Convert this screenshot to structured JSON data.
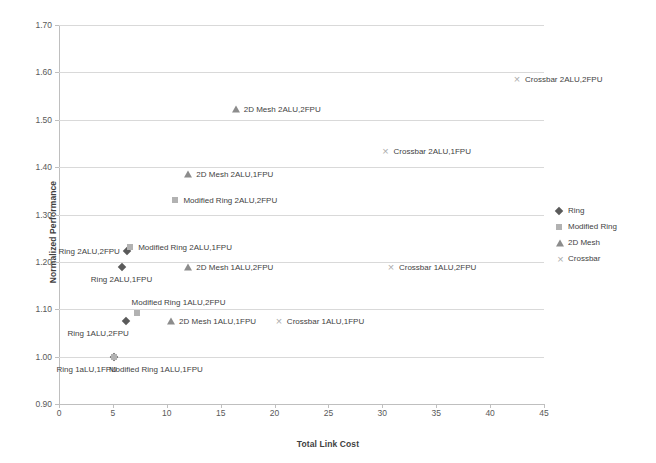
{
  "chart_data": {
    "type": "scatter",
    "title": "",
    "xlabel": "Total Link Cost",
    "ylabel": "Normalized Performance",
    "xlim": [
      0,
      45
    ],
    "ylim": [
      0.9,
      1.7
    ],
    "xticks": [
      "0",
      "5",
      "10",
      "15",
      "20",
      "25",
      "30",
      "35",
      "40",
      "45"
    ],
    "xtick_values": [
      0,
      5,
      10,
      15,
      20,
      25,
      30,
      35,
      40,
      45
    ],
    "yticks": [
      "0.90",
      "1.00",
      "1.10",
      "1.20",
      "1.30",
      "1.40",
      "1.50",
      "1.60",
      "1.70"
    ],
    "ytick_values": [
      0.9,
      1.0,
      1.1,
      1.2,
      1.3,
      1.4,
      1.5,
      1.6,
      1.7
    ],
    "grid": "horizontal",
    "legend_position": "right",
    "series": [
      {
        "name": "Ring",
        "marker": "diamond",
        "color": "#5a5a5a",
        "points": [
          {
            "label": "Ring 2ALU,2FPU",
            "x": 6.3,
            "y": 1.222,
            "label_side": "left"
          },
          {
            "label": "Ring 2ALU,1FPU",
            "x": 5.8,
            "y": 1.19,
            "label_side": "below"
          },
          {
            "label": "Ring 1ALU,2FPU",
            "x": 6.2,
            "y": 1.075,
            "label_side": "below-left"
          },
          {
            "label": "Ring 1aLU,1FPU",
            "x": 5.1,
            "y": 1.0,
            "label_side": "below-left"
          }
        ]
      },
      {
        "name": "Modified Ring",
        "marker": "square",
        "color": "#b2b2b2",
        "points": [
          {
            "label": "Modified Ring 2ALU,2FPU",
            "x": 10.8,
            "y": 1.33,
            "label_side": "right"
          },
          {
            "label": "Modified Ring 2ALU,1FPU",
            "x": 6.6,
            "y": 1.232,
            "label_side": "right"
          },
          {
            "label": "Modified Ring 1ALU,2FPU",
            "x": 7.2,
            "y": 1.093,
            "label_side": "above-right"
          },
          {
            "label": "Modified Ring 1ALU,1FPU",
            "x": 5.1,
            "y": 1.0,
            "label_side": "below-right"
          }
        ]
      },
      {
        "name": "2D Mesh",
        "marker": "triangle",
        "color": "#8c8c8c",
        "points": [
          {
            "label": "2D Mesh 2ALU,2FPU",
            "x": 16.4,
            "y": 1.522,
            "label_side": "right"
          },
          {
            "label": "2D Mesh 2ALU,1FPU",
            "x": 12.0,
            "y": 1.385,
            "label_side": "right"
          },
          {
            "label": "2D Mesh 1ALU,2FPU",
            "x": 12.0,
            "y": 1.19,
            "label_side": "right"
          },
          {
            "label": "2D Mesh 1ALU,1FPU",
            "x": 10.4,
            "y": 1.075,
            "label_side": "right"
          }
        ]
      },
      {
        "name": "Crossbar",
        "marker": "cross",
        "color": "#adadad",
        "points": [
          {
            "label": "Crossbar 2ALU,2FPU",
            "x": 42.5,
            "y": 1.585,
            "label_side": "right"
          },
          {
            "label": "Crossbar 2ALU,1FPU",
            "x": 30.3,
            "y": 1.433,
            "label_side": "right"
          },
          {
            "label": "Crossbar 1ALU,2FPU",
            "x": 30.8,
            "y": 1.19,
            "label_side": "right"
          },
          {
            "label": "Crossbar 1ALU,1FPU",
            "x": 20.4,
            "y": 1.075,
            "label_side": "right"
          }
        ]
      }
    ],
    "legend_entries": [
      {
        "label": "Ring",
        "marker": "diamond"
      },
      {
        "label": "Modified Ring",
        "marker": "square"
      },
      {
        "label": "2D Mesh",
        "marker": "triangle"
      },
      {
        "label": "Crossbar",
        "marker": "cross"
      }
    ]
  }
}
